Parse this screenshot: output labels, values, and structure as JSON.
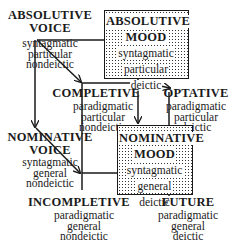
{
  "diagram": {
    "nodes": {
      "absolutive_voice": {
        "title1": "ABSOLUTIVE",
        "title2": "VOICE",
        "features": [
          "syntagmatic",
          "particular",
          "nondeictic"
        ]
      },
      "absolutive_mood": {
        "title1": "ABSOLUTIVE",
        "title2": "MOOD",
        "features": [
          "syntagmatic",
          "particular",
          "deictic"
        ],
        "boxed": true,
        "shaded": true
      },
      "completive": {
        "title1": "COMPLETIVE",
        "features": [
          "paradigmatic",
          "particular",
          "nondeictic"
        ]
      },
      "optative": {
        "title1": "OPTATIVE",
        "features": [
          "paradigmatic",
          "particular",
          "deictic"
        ]
      },
      "nominative_voice": {
        "title1": "NOMINATIVE",
        "title2": "VOICE",
        "features": [
          "syntagmatic",
          "general",
          "nondeictic"
        ]
      },
      "nominative_mood": {
        "title1": "NOMINATIVE",
        "title2": "MOOD",
        "features": [
          "syntagmatic",
          "general",
          "deictic"
        ],
        "boxed": true,
        "shaded": true
      },
      "incompletive": {
        "title1": "INCOMPLETIVE",
        "features": [
          "paradigmatic",
          "general",
          "nondeictic"
        ]
      },
      "future": {
        "title1": "FUTURE",
        "features": [
          "paradigmatic",
          "general",
          "deictic"
        ]
      }
    },
    "edges": [
      {
        "from": "absolutive_voice",
        "to": "absolutive_mood",
        "arrow": false
      },
      {
        "from": "absolutive_voice",
        "to": "completive",
        "arrow": true
      },
      {
        "from": "absolutive_voice",
        "to": "nominative_voice",
        "arrow": true
      },
      {
        "from": "absolutive_mood",
        "to": "optative",
        "arrow": true
      },
      {
        "from": "absolutive_mood",
        "to": "nominative_mood",
        "arrow": true
      },
      {
        "from": "completive",
        "to": "incompletive",
        "arrow": false
      },
      {
        "from": "completive",
        "to": "optative",
        "arrow": true
      },
      {
        "from": "nominative_voice",
        "to": "incompletive",
        "arrow": true
      },
      {
        "from": "nominative_voice",
        "to": "nominative_mood",
        "arrow": false
      },
      {
        "from": "nominative_mood",
        "to": "future",
        "arrow": true
      },
      {
        "from": "optative",
        "to": "future",
        "arrow": false
      }
    ],
    "colors": {
      "ink": "#1a1a1a",
      "background": "#ffffff"
    }
  }
}
